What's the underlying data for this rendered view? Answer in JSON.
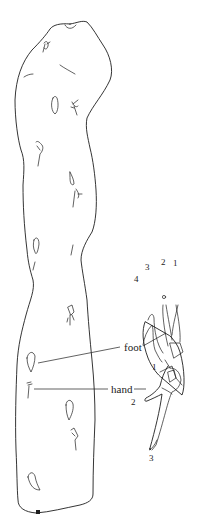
{
  "diagram": {
    "type": "archaeological line drawing of a stone slab with trackways",
    "labels": {
      "foot": "foot",
      "hand": "hand"
    },
    "foot_digits": [
      "1",
      "2",
      "3",
      "4"
    ],
    "hand_digits": [
      "1",
      "2",
      "3"
    ],
    "colors": {
      "ink": "#1e1e1e",
      "background": "#ffffff"
    }
  }
}
